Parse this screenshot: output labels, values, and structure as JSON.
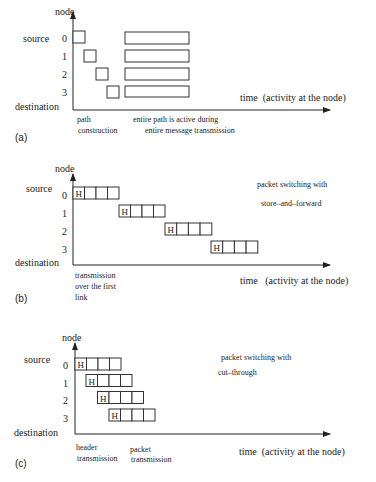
{
  "figure": {
    "panels": [
      {
        "id": "a",
        "label": "(a)",
        "y_axis_label": "node",
        "x_axis_label": "time  (activity at the node)",
        "node_labels": [
          "0",
          "1",
          "2",
          "3"
        ],
        "source_label": "source",
        "destination_label": "destination",
        "title_lines": [],
        "annotations": [
          {
            "lines": [
              "path",
              "construction"
            ]
          },
          {
            "lines": [
              "entire path is active during",
              "entire message transmission"
            ]
          }
        ]
      },
      {
        "id": "b",
        "label": "(b)",
        "y_axis_label": "node",
        "x_axis_label": "time   (activity at the node)",
        "node_labels": [
          "0",
          "1",
          "2",
          "3"
        ],
        "source_label": "source",
        "destination_label": "destination",
        "title_lines": [
          "packet switching with",
          "store–and–forward"
        ],
        "header_cell": "H",
        "annotations": [
          {
            "lines": [
              "transmission",
              "over the first",
              "link"
            ]
          }
        ]
      },
      {
        "id": "c",
        "label": "(c)",
        "y_axis_label": "node",
        "x_axis_label": "time  (activity at the node)",
        "node_labels": [
          "0",
          "1",
          "2",
          "3"
        ],
        "source_label": "source",
        "destination_label": "destination",
        "title_lines": [
          "packet switching with",
          "cut–through"
        ],
        "header_cell": "H",
        "annotations": [
          {
            "lines": [
              "header",
              "transmission"
            ]
          },
          {
            "lines": [
              "packet",
              "transmission"
            ]
          }
        ]
      }
    ]
  }
}
